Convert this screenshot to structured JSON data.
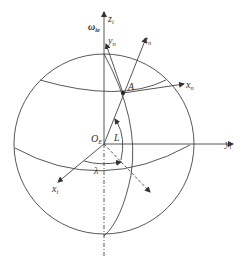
{
  "diagram": {
    "type": "coordinate-frame-on-sphere",
    "labels": {
      "omega": "ω",
      "omega_sub": "ie",
      "z_i": "z",
      "z_i_sub": "i",
      "y_n": "y",
      "y_n_sub": "n",
      "z_n": "z",
      "z_n_sub": "n",
      "x_n": "x",
      "x_n_sub": "n",
      "point_A": "A",
      "origin": "O",
      "origin_sub": "E",
      "latitude": "L",
      "longitude": "λ",
      "x_i": "x",
      "x_i_sub": "i",
      "y_i": "y",
      "y_i_sub": "i"
    },
    "colors": {
      "stroke": "#444444",
      "text": "#333333",
      "background": "#ffffff"
    }
  }
}
